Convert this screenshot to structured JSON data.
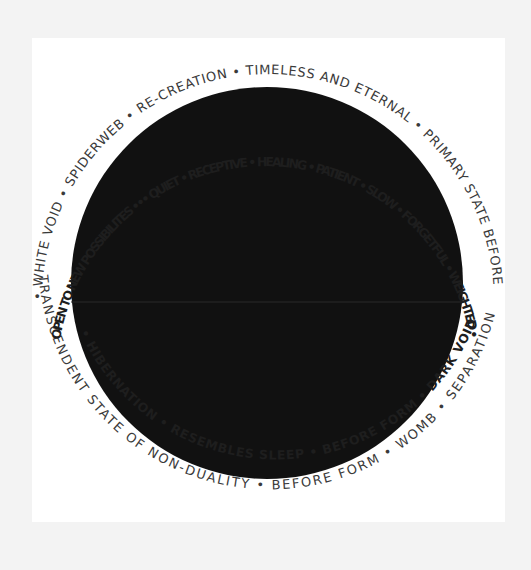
{
  "artwork": {
    "description": "Hand-lettered mandala: black circle surrounded by two rings of words",
    "colors": {
      "background": "#f3f3f3",
      "panel": "#ffffff",
      "circle": "#111111",
      "text": "#333333"
    },
    "outer_ring": {
      "top": "• WHITE VOID • SPIDERWEB • RE-CREATION • TIMELESS AND ETERNAL • PRIMARY STATE BEFORE",
      "bottom": "TRANSCENDENT STATE OF NON-DUALITY • BEFORE FORM • WOMB • SEPARATION"
    },
    "inner_ring": {
      "top": "OPEN TO NEW POSSIBILITES ••• QUIET • RECEPTIVE • HEALING • PATIENT • SLOW • FORGETFUL • WEIGHTED •",
      "bottom": "• HIBERNATION • RESEMBLES SLEEP • BEFORE FORM • DARK VOID"
    }
  }
}
